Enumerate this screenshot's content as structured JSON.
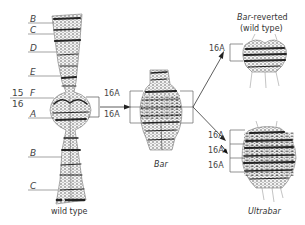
{
  "figure": {
    "topic": "Bar eye duplication in Drosophila polytene X chromosome",
    "wild_type": {
      "band_labels": [
        "B",
        "C",
        "D",
        "E",
        "F",
        "A",
        "B",
        "C"
      ],
      "region_15": "15",
      "region_16": "16",
      "caption": "wild type"
    },
    "bar": {
      "segments": [
        "16A",
        "16A"
      ],
      "caption": "Bar"
    },
    "bar_reverted": {
      "title_italic": "Bar",
      "title_rest": "-reverted",
      "subtitle": "(wild type)",
      "segments": [
        "16A"
      ]
    },
    "ultrabar": {
      "segments": [
        "16A",
        "16A",
        "16A"
      ],
      "caption": "Ultrabar"
    },
    "colors": {
      "ink": "#222222",
      "line": "#555555",
      "background": "#ffffff"
    }
  }
}
